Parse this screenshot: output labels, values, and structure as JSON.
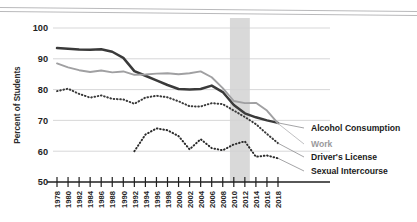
{
  "chart_data": {
    "type": "line",
    "title": "",
    "subtitle": "",
    "xlabel": "",
    "ylabel": "Percent of Students",
    "xlim": [
      1978,
      2018
    ],
    "ylim": [
      50,
      100
    ],
    "yticks": [
      50,
      60,
      70,
      80,
      90,
      100
    ],
    "grid": true,
    "legend_position": "right",
    "x": [
      1978,
      1980,
      1982,
      1984,
      1986,
      1988,
      1990,
      1992,
      1994,
      1996,
      1998,
      2000,
      2002,
      2004,
      2006,
      2008,
      2010,
      2012,
      2014,
      2016,
      2018
    ],
    "annotations": [
      {
        "type": "vspan",
        "label": "",
        "x_start": 2009.3,
        "x_end": 2012.9,
        "color": "#d9d9d9"
      }
    ],
    "series": [
      {
        "name": "Alcohol Consumption",
        "style": "solid",
        "color": "#3a3a3a",
        "values": [
          93.5,
          93.3,
          93.0,
          92.9,
          93.1,
          92.3,
          90.3,
          86.0,
          84.5,
          83.0,
          81.5,
          80.2,
          80.0,
          80.2,
          81.3,
          79.2,
          75.0,
          72.3,
          71.0,
          70.0,
          69.2
        ]
      },
      {
        "name": "Work",
        "style": "solid",
        "color": "#a0a0a2",
        "values": [
          88.5,
          87.2,
          86.3,
          85.7,
          86.2,
          85.6,
          85.9,
          84.8,
          84.9,
          85.2,
          85.3,
          85.0,
          85.3,
          85.9,
          84.0,
          80.5,
          76.3,
          75.6,
          75.7,
          73.2,
          69.0
        ]
      },
      {
        "name": "Driver's License",
        "style": "dotted",
        "color": "#3a3a3a",
        "values": [
          79.5,
          80.3,
          78.6,
          77.4,
          78.1,
          77.0,
          76.8,
          75.4,
          77.4,
          78.0,
          77.5,
          76.2,
          74.6,
          74.5,
          75.6,
          75.3,
          73.2,
          71.1,
          68.8,
          65.6,
          62.6
        ]
      },
      {
        "name": "Sexual Intercourse",
        "style": "dotted",
        "color": "#2b2b2b",
        "values": [
          null,
          null,
          null,
          null,
          null,
          null,
          null,
          60.0,
          65.4,
          67.4,
          66.8,
          64.9,
          60.6,
          63.9,
          61.0,
          60.3,
          62.2,
          63.2,
          58.2,
          58.6,
          57.7
        ]
      }
    ]
  },
  "axis": {
    "ylabel": "Percent of Students",
    "ytick_labels": [
      "100",
      "90",
      "80",
      "70",
      "60",
      "50"
    ],
    "xtick_labels": [
      "1978",
      "1980",
      "1982",
      "1984",
      "1986",
      "1988",
      "1990",
      "1992",
      "1994",
      "1996",
      "1998",
      "2000",
      "2002",
      "2004",
      "2006",
      "2008",
      "2010",
      "2012",
      "2014",
      "2016",
      "2018"
    ]
  },
  "legend": {
    "items": [
      {
        "label": "Alcohol Consumption",
        "color": "#1b1b1b"
      },
      {
        "label": "Work",
        "color": "#9a9a9c"
      },
      {
        "label": "Driver's License",
        "color": "#1b1b1b"
      },
      {
        "label": "Sexual Intercourse",
        "color": "#1b1b1b"
      }
    ]
  }
}
